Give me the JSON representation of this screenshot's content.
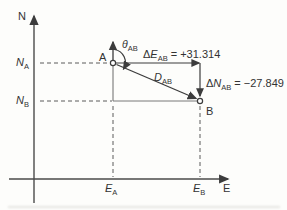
{
  "figure": {
    "colors": {
      "background": "#fdfdfb",
      "line": "#4a4a4a",
      "thin_line": "#6a6a6a",
      "text": "#333333"
    },
    "axes": {
      "y_label": "N",
      "x_label": "E"
    },
    "points": {
      "a": "A",
      "b": "B"
    },
    "ticks": {
      "n_a": {
        "symbol": "N",
        "sub": "A"
      },
      "n_b": {
        "symbol": "N",
        "sub": "B"
      },
      "e_a": {
        "symbol": "E",
        "sub": "A"
      },
      "e_b": {
        "symbol": "E",
        "sub": "B"
      }
    },
    "annotations": {
      "bearing": {
        "symbol": "θ",
        "sub": "AB"
      },
      "distance": {
        "symbol": "D",
        "sub": "AB"
      },
      "delta_e": {
        "prefix": "Δ",
        "symbol": "E",
        "sub": "AB",
        "value": "= +31.314"
      },
      "delta_n": {
        "prefix": "Δ",
        "symbol": "N",
        "sub": "AB",
        "value": "= −27.849"
      }
    }
  }
}
